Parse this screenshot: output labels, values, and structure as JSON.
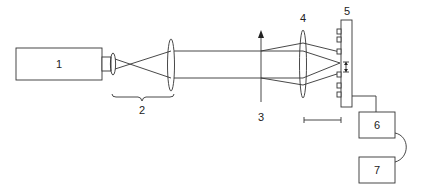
{
  "diagram": {
    "type": "optical-setup-schematic",
    "labels": {
      "laser": "1",
      "beam_expander": "2",
      "beam_axis": "3",
      "focusing_lens": "4",
      "sample_plate": "5",
      "controller": "6",
      "computer": "7"
    },
    "colors": {
      "stroke": "#333333",
      "background": "#ffffff",
      "text": "#222222"
    }
  }
}
